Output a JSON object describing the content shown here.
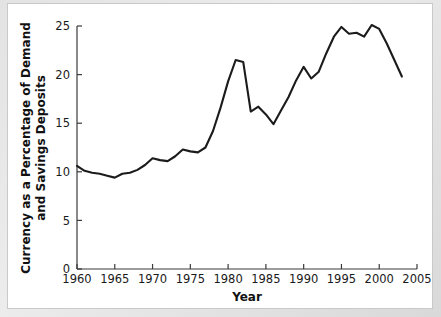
{
  "figure": {
    "background_color": "#ffffff",
    "frame_color": "#c9c9c9",
    "line_color": "#1b1b1b"
  },
  "chart_data": {
    "type": "line",
    "title": "",
    "xlabel": "Year",
    "ylabel": "Currency as a Percentage of Demand and Savings Deposits",
    "ylabel_line1": "Currency as a Percentage of Demand",
    "ylabel_line2": "and Savings Deposits",
    "xlim": [
      1960,
      2005
    ],
    "ylim": [
      0,
      25
    ],
    "xticks": [
      1960,
      1965,
      1970,
      1975,
      1980,
      1985,
      1990,
      1995,
      2000,
      2005
    ],
    "xtick_labels": [
      "1960",
      "1965",
      "1970",
      "1975",
      "1980",
      "1985",
      "1990",
      "1995",
      "2000",
      "2005"
    ],
    "yticks": [
      0,
      5,
      10,
      15,
      20,
      25
    ],
    "ytick_labels": [
      "0",
      "5",
      "10",
      "15",
      "20",
      "25"
    ],
    "grid": false,
    "legend": false,
    "legend_position": "none",
    "series": [
      {
        "name": "Currency as a Percentage of Demand and Savings Deposits",
        "color": "#1b1b1b",
        "x": [
          1960,
          1961,
          1962,
          1963,
          1964,
          1965,
          1966,
          1967,
          1968,
          1969,
          1970,
          1971,
          1972,
          1973,
          1974,
          1975,
          1976,
          1977,
          1978,
          1979,
          1980,
          1981,
          1982,
          1983,
          1984,
          1985,
          1986,
          1987,
          1988,
          1989,
          1990,
          1991,
          1992,
          1993,
          1994,
          1995,
          1996,
          1997,
          1998,
          1999,
          2000,
          2001,
          2002,
          2003
        ],
        "y": [
          10.6,
          10.1,
          9.9,
          9.8,
          9.6,
          9.4,
          9.8,
          9.9,
          10.2,
          10.7,
          11.4,
          11.2,
          11.1,
          11.6,
          12.3,
          12.1,
          12.0,
          12.5,
          14.2,
          16.6,
          19.3,
          21.5,
          21.3,
          16.2,
          16.7,
          15.9,
          14.9,
          16.3,
          17.7,
          19.4,
          20.8,
          19.6,
          20.3,
          22.2,
          23.9,
          24.9,
          24.2,
          24.3,
          23.9,
          25.1,
          24.7,
          23.2,
          21.5,
          19.8
        ]
      }
    ]
  }
}
